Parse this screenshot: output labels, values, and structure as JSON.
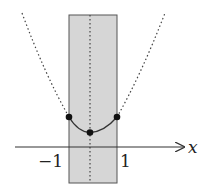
{
  "diagram": {
    "axis": {
      "label": "x"
    },
    "ticks": [
      {
        "label": "−1",
        "value": -1
      },
      {
        "label": "1",
        "value": 1
      }
    ],
    "shaded_region": {
      "from": -1,
      "to": 1,
      "fill": "#d6d6d6"
    },
    "curve": {
      "type": "parabola",
      "solid_within": [
        -1,
        1
      ],
      "dotted_outside": true
    },
    "points": [
      {
        "x": -1,
        "name": "left-endpoint"
      },
      {
        "x": 0,
        "name": "vertex"
      },
      {
        "x": 1,
        "name": "right-endpoint"
      }
    ],
    "colors": {
      "line": "#333333",
      "shade": "#d6d6d6",
      "shade_border": "#555555"
    }
  }
}
